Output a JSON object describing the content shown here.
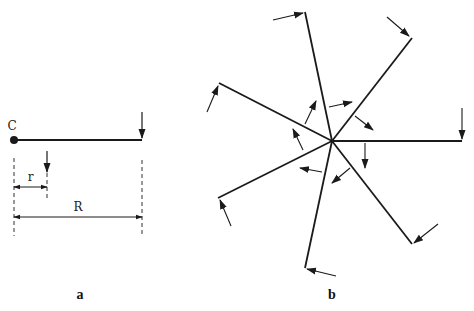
{
  "colors": {
    "stroke": "#1a1a1a",
    "background": "#ffffff"
  },
  "panel_a": {
    "label": "a",
    "point_label": "C",
    "radius_label": "r",
    "length_label": "R",
    "beam": {
      "x1": 14,
      "y1": 140,
      "x2": 142,
      "y2": 140
    },
    "end_arrow": {
      "x1": 142,
      "y1": 112,
      "x2": 142,
      "y2": 138
    },
    "mid_arrow": {
      "x1": 47,
      "y1": 151,
      "x2": 47,
      "y2": 172
    },
    "dash_left": {
      "x": 14,
      "y1": 158,
      "y2": 236
    },
    "dash_mid": {
      "x": 47,
      "y1": 173,
      "y2": 198
    },
    "dash_right": {
      "x": 142,
      "y1": 160,
      "y2": 236
    },
    "r_dim": {
      "x1": 14,
      "x2": 47,
      "y": 187
    },
    "R_dim": {
      "x1": 14,
      "x2": 142,
      "y": 217
    }
  },
  "panel_b": {
    "label": "b",
    "center": {
      "x": 332,
      "y": 141
    },
    "rays": [
      {
        "x": 305,
        "y": 12
      },
      {
        "x": 412,
        "y": 38
      },
      {
        "x": 219,
        "y": 83
      },
      {
        "x": 462,
        "y": 141
      },
      {
        "x": 218,
        "y": 198
      },
      {
        "x": 412,
        "y": 244
      },
      {
        "x": 305,
        "y": 268
      }
    ],
    "outer_arrows": [
      {
        "x1": 273,
        "y1": 20,
        "x2": 303,
        "y2": 13
      },
      {
        "x1": 387,
        "y1": 17,
        "x2": 409,
        "y2": 36
      },
      {
        "x1": 207,
        "y1": 112,
        "x2": 218,
        "y2": 86
      },
      {
        "x1": 462,
        "y1": 108,
        "x2": 462,
        "y2": 139
      },
      {
        "x1": 231,
        "y1": 226,
        "x2": 220,
        "y2": 200
      },
      {
        "x1": 438,
        "y1": 224,
        "x2": 414,
        "y2": 243
      },
      {
        "x1": 336,
        "y1": 276,
        "x2": 307,
        "y2": 269
      }
    ],
    "inner_arrows": [
      {
        "x1": 305,
        "y1": 124,
        "x2": 316,
        "y2": 101
      },
      {
        "x1": 329,
        "y1": 107,
        "x2": 352,
        "y2": 102
      },
      {
        "x1": 355,
        "y1": 116,
        "x2": 373,
        "y2": 130
      },
      {
        "x1": 365,
        "y1": 143,
        "x2": 365,
        "y2": 168
      },
      {
        "x1": 350,
        "y1": 168,
        "x2": 332,
        "y2": 183
      },
      {
        "x1": 322,
        "y1": 172,
        "x2": 300,
        "y2": 168
      },
      {
        "x1": 303,
        "y1": 150,
        "x2": 293,
        "y2": 129
      }
    ]
  }
}
